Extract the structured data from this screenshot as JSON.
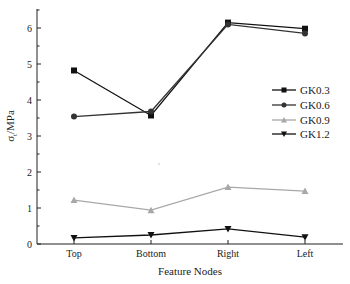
{
  "chart_data": {
    "type": "line",
    "title": "",
    "xlabel": "Feature Nodes",
    "ylabel": "σ_t/MPa",
    "ylabel_main": "σ",
    "ylabel_sub": "t",
    "ylabel_unit": "/MPa",
    "categories": [
      "Top",
      "Bottom",
      "Right",
      "Left"
    ],
    "ylim": [
      0,
      6.5
    ],
    "yticks": [
      0,
      1,
      2,
      3,
      4,
      5,
      6
    ],
    "grid": false,
    "legend_position": "right-middle",
    "series": [
      {
        "name": "GK0.3",
        "marker": "square",
        "color": "#111111",
        "values": [
          4.82,
          3.57,
          6.15,
          5.98
        ]
      },
      {
        "name": "GK0.6",
        "marker": "circle",
        "color": "#333333",
        "values": [
          3.54,
          3.68,
          6.1,
          5.85
        ]
      },
      {
        "name": "GK0.9",
        "marker": "triangle-up",
        "color": "#a8a8a8",
        "values": [
          1.22,
          0.94,
          1.58,
          1.47
        ]
      },
      {
        "name": "GK1.2",
        "marker": "triangle-down",
        "color": "#111111",
        "values": [
          0.17,
          0.25,
          0.42,
          0.19
        ]
      }
    ]
  }
}
